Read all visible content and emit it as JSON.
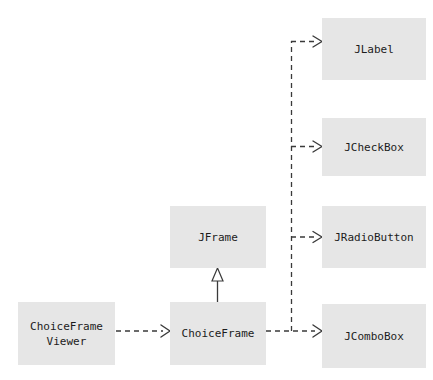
{
  "diagram": {
    "type": "uml-class-diagram",
    "background_color": "#ffffff",
    "box_fill_color": "#e6e6e6",
    "line_color": "#3a3a3a",
    "text_color": "#1c1c1c",
    "classes": [
      {
        "id": "jlabel",
        "label": "JLabel",
        "x": 322,
        "y": 18,
        "width": 104,
        "height": 62
      },
      {
        "id": "jcheckbox",
        "label": "JCheckBox",
        "x": 322,
        "y": 118,
        "width": 104,
        "height": 58
      },
      {
        "id": "jradiobutton",
        "label": "JRadioButton",
        "x": 322,
        "y": 206,
        "width": 104,
        "height": 62
      },
      {
        "id": "jcombobox",
        "label": "JComboBox",
        "x": 322,
        "y": 304,
        "width": 104,
        "height": 64
      },
      {
        "id": "jframe",
        "label": "JFrame",
        "x": 170,
        "y": 206,
        "width": 96,
        "height": 62
      },
      {
        "id": "choiceframe",
        "label": "ChoiceFrame",
        "x": 170,
        "y": 302,
        "width": 96,
        "height": 63
      },
      {
        "id": "choiceframeviewer",
        "label": "ChoiceFrame\nViewer",
        "x": 18,
        "y": 302,
        "width": 97,
        "height": 63
      }
    ],
    "relationships": [
      {
        "id": "viewer-to-choiceframe",
        "kind": "dependency",
        "style": "dashed",
        "arrowhead": "open",
        "from": "choiceframeviewer",
        "to": "choiceframe"
      },
      {
        "id": "choiceframe-to-jframe",
        "kind": "inheritance",
        "style": "solid",
        "arrowhead": "hollow-triangle",
        "from": "choiceframe",
        "to": "jframe"
      },
      {
        "id": "choiceframe-to-jcombobox",
        "kind": "dependency",
        "style": "dashed",
        "arrowhead": "open",
        "from": "choiceframe",
        "to": "jcombobox"
      },
      {
        "id": "choiceframe-to-jlabel",
        "kind": "dependency",
        "style": "dashed",
        "arrowhead": "open",
        "from": "choiceframe",
        "to": "jlabel"
      },
      {
        "id": "choiceframe-to-jcheckbox",
        "kind": "dependency",
        "style": "dashed",
        "arrowhead": "open",
        "from": "choiceframe",
        "to": "jcheckbox"
      },
      {
        "id": "choiceframe-to-jradiobutton",
        "kind": "dependency",
        "style": "dashed",
        "arrowhead": "open",
        "from": "choiceframe",
        "to": "jradiobutton"
      }
    ]
  }
}
